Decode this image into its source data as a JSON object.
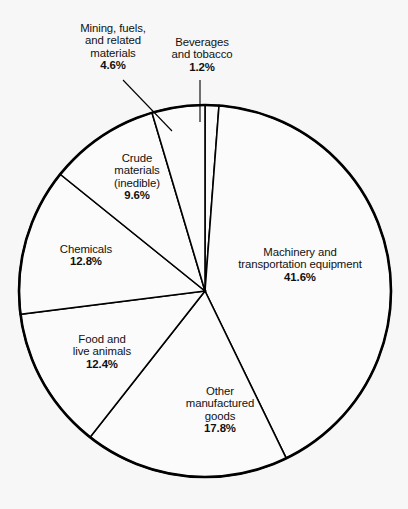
{
  "chart_data": {
    "type": "pie",
    "title": "",
    "subtitle": "",
    "xlabel": "",
    "ylabel": "",
    "legend_position": "none",
    "grid": false,
    "value_unit": "percent",
    "total": 100.0,
    "start_angle_deg": 0,
    "direction": "clockwise",
    "categories": [
      "Beverages and tobacco",
      "Machinery and transportation equipment",
      "Other manufactured goods",
      "Food and live animals",
      "Chemicals",
      "Crude materials (inedible)",
      "Mining, fuels, and related materials"
    ],
    "values": [
      1.2,
      41.6,
      17.8,
      12.4,
      12.8,
      9.6,
      4.6
    ],
    "slices": [
      {
        "id": "beverages",
        "label_lines": [
          "Beverages",
          "and tobacco"
        ],
        "percent_text": "1.2%",
        "value": 1.2,
        "has_leader_line": true
      },
      {
        "id": "machinery",
        "label_lines": [
          "Machinery and",
          "transportation equipment"
        ],
        "percent_text": "41.6%",
        "value": 41.6,
        "has_leader_line": false
      },
      {
        "id": "other-manufactured",
        "label_lines": [
          "Other",
          "manufactured",
          "goods"
        ],
        "percent_text": "17.8%",
        "value": 17.8,
        "has_leader_line": false
      },
      {
        "id": "food",
        "label_lines": [
          "Food and",
          "live animals"
        ],
        "percent_text": "12.4%",
        "value": 12.4,
        "has_leader_line": false
      },
      {
        "id": "chemicals",
        "label_lines": [
          "Chemicals"
        ],
        "percent_text": "12.8%",
        "value": 12.8,
        "has_leader_line": false
      },
      {
        "id": "crude-materials",
        "label_lines": [
          "Crude",
          "materials",
          "(inedible)"
        ],
        "percent_text": "9.6%",
        "value": 9.6,
        "has_leader_line": false
      },
      {
        "id": "mining-fuels",
        "label_lines": [
          "Mining, fuels,",
          "and related",
          "materials"
        ],
        "percent_text": "4.6%",
        "value": 4.6,
        "has_leader_line": true
      }
    ],
    "colors": {
      "slice_fill": "#fbfbfb",
      "slice_stroke": "#000000",
      "background": "#f7f7f7",
      "text": "#111111"
    }
  },
  "labels": {
    "mining": {
      "l1": "Mining, fuels,",
      "l2": "and related",
      "l3": "materials",
      "pct": "4.6%"
    },
    "beverages": {
      "l1": "Beverages",
      "l2": "and tobacco",
      "pct": "1.2%"
    },
    "crude": {
      "l1": "Crude",
      "l2": "materials",
      "l3": "(inedible)",
      "pct": "9.6%"
    },
    "chemicals": {
      "l1": "Chemicals",
      "pct": "12.8%"
    },
    "food": {
      "l1": "Food and",
      "l2": "live animals",
      "pct": "12.4%"
    },
    "other": {
      "l1": "Other",
      "l2": "manufactured",
      "l3": "goods",
      "pct": "17.8%"
    },
    "machinery": {
      "l1": "Machinery and",
      "l2": "transportation equipment",
      "pct": "41.6%"
    }
  }
}
